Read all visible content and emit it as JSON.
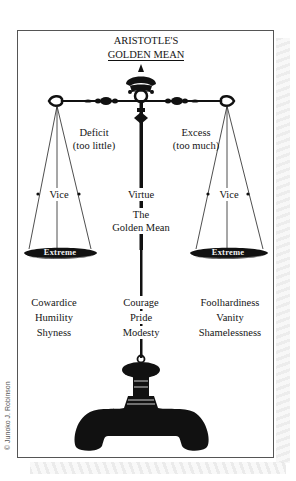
{
  "title": {
    "line1": "ARISTOTLE'S",
    "line2": "GOLDEN MEAN"
  },
  "left_side": {
    "heading_line1": "Deficit",
    "heading_line2": "(too little)",
    "vice_label": "Vice",
    "pan_label": "Extreme",
    "examples": [
      "Cowardice",
      "Humility",
      "Shyness"
    ]
  },
  "center": {
    "virtue_label": "Virtue",
    "mean_line1": "The",
    "mean_line2": "Golden Mean",
    "examples": [
      "Courage",
      "Pride",
      "Modesty"
    ]
  },
  "right_side": {
    "heading_line1": "Excess",
    "heading_line2": "(too much)",
    "vice_label": "Vice",
    "pan_label": "Extreme",
    "examples": [
      "Foolhardiness",
      "Vanity",
      "Shamelessness"
    ]
  },
  "credit": "© Junoko J. Robinson",
  "colors": {
    "ink": "#111111",
    "frame": "#555555",
    "background": "#ffffff"
  }
}
